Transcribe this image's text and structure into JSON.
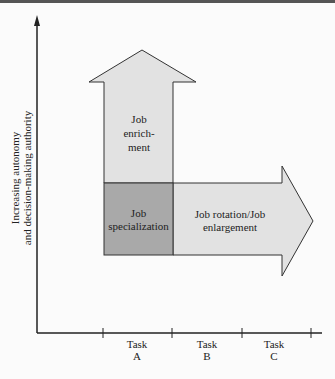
{
  "diagram": {
    "y_axis_label": [
      "Increasing autonomy",
      "and decision-making authority"
    ],
    "x_axis_ticks": [
      {
        "line1": "Task",
        "line2": "A"
      },
      {
        "line1": "Task",
        "line2": "B"
      },
      {
        "line1": "Task",
        "line2": "C"
      }
    ],
    "boxes": {
      "enrichment": [
        "Job",
        "enrich-",
        "ment"
      ],
      "specialization": [
        "Job",
        "specialization"
      ],
      "rotation": [
        "Job rotation/Job",
        "enlargement"
      ]
    },
    "colors": {
      "light_fill": "#e2e2e2",
      "dark_fill": "#a9a9a9",
      "stroke": "#333333"
    }
  }
}
